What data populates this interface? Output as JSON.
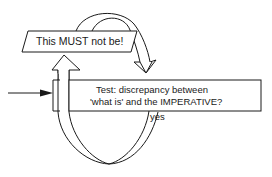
{
  "diagram": {
    "type": "feedback-loop flowchart",
    "nodes": {
      "imperative": {
        "label": "This MUST not be!",
        "shape": "parallelogram"
      },
      "test": {
        "label_line1": "Test: discrepancy between",
        "label_line2": "'what is' and the IMPERATIVE?",
        "shape": "rectangle"
      }
    },
    "edges": [
      {
        "from": "input",
        "to": "test",
        "label": ""
      },
      {
        "from": "test",
        "to": "imperative",
        "label": "yes",
        "style": "double-line loop"
      },
      {
        "from": "imperative",
        "to": "test",
        "label": "",
        "style": "double-line arc"
      }
    ],
    "colors": {
      "stroke": "#1a1a1a",
      "background": "#ffffff"
    }
  }
}
